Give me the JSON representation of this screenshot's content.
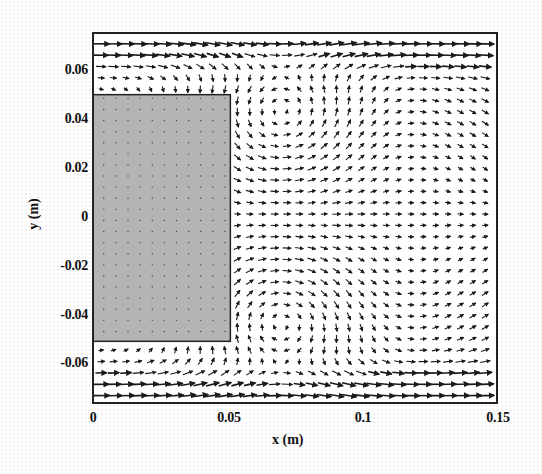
{
  "chart_data": {
    "type": "vector-field",
    "title": "",
    "xlabel": "x (m)",
    "ylabel": "y (m)",
    "xlim": [
      0,
      0.15
    ],
    "ylim": [
      -0.075,
      0.075
    ],
    "xticks": [
      0,
      0.05,
      0.1,
      0.15
    ],
    "xtick_labels": [
      "0",
      "0.05",
      "0.1",
      "0.15"
    ],
    "yticks": [
      0.06,
      0.04,
      0.02,
      0,
      -0.02,
      -0.04,
      -0.06
    ],
    "ytick_labels": [
      "0.06",
      "0.04",
      "0.02",
      "0",
      "-0.02",
      "-0.04",
      "-0.06"
    ],
    "grid": false,
    "legend": null,
    "obstacle": {
      "shape": "rectangle",
      "x_range": [
        0,
        0.051
      ],
      "y_range": [
        -0.05,
        0.05
      ],
      "fill": "#b4b4b4"
    },
    "features": [
      {
        "type": "vortex",
        "center": [
          0.07,
          0.043
        ],
        "rotation": "counterclockwise",
        "label": "upper recirculation"
      },
      {
        "type": "vortex",
        "center": [
          0.07,
          -0.043
        ],
        "rotation": "clockwise",
        "label": "lower recirculation"
      },
      {
        "type": "jet",
        "y_range": [
          0.058,
          0.075
        ],
        "direction": "+x",
        "speed": "high"
      },
      {
        "type": "jet",
        "y_range": [
          -0.075,
          -0.058
        ],
        "direction": "+x",
        "speed": "high"
      },
      {
        "type": "wake-centerline",
        "y": 0,
        "direction": "+x/-x",
        "speed": "low"
      }
    ],
    "arrow_color": "#1a1a1a",
    "frame_color": "#222222"
  },
  "axes": {
    "x_label": "x (m)",
    "y_label": "y (m)",
    "x_ticks": [
      "0",
      "0.05",
      "0.1",
      "0.15"
    ],
    "y_ticks": [
      "0.06",
      "0.04",
      "0.02",
      "0",
      "-0.02",
      "-0.04",
      "-0.06"
    ]
  }
}
